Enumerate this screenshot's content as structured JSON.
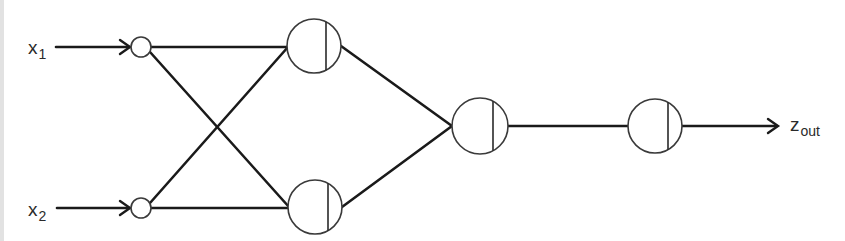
{
  "diagram": {
    "type": "feedforward-neural-network",
    "inputs": [
      {
        "id": "x1",
        "label": "x",
        "subscript": "1",
        "x": 28,
        "y": 54,
        "arrow_from": 56,
        "node": {
          "cx": 141,
          "cy": 47,
          "r": 10
        }
      },
      {
        "id": "x2",
        "label": "x",
        "subscript": "2",
        "x": 28,
        "y": 216,
        "arrow_from": 56,
        "node": {
          "cx": 141,
          "cy": 208,
          "r": 10
        }
      }
    ],
    "hidden_layer_1": [
      {
        "id": "h1",
        "cx": 314,
        "cy": 46,
        "r": 27,
        "divider_x": 326
      },
      {
        "id": "h2",
        "cx": 315,
        "cy": 207,
        "r": 27,
        "divider_x": 328
      }
    ],
    "hidden_layer_2": [
      {
        "id": "h3",
        "cx": 480,
        "cy": 126,
        "r": 28,
        "divider_x": 493
      }
    ],
    "output_layer": [
      {
        "id": "o1",
        "cx": 655,
        "cy": 126,
        "r": 27,
        "divider_x": 668
      }
    ],
    "output": {
      "label": "z",
      "subscript": "out",
      "arrow_to": 778,
      "x": 790,
      "y": 133
    },
    "connections": [
      {
        "from": "x1",
        "to": "h1"
      },
      {
        "from": "x1",
        "to": "h2"
      },
      {
        "from": "x2",
        "to": "h1"
      },
      {
        "from": "x2",
        "to": "h2"
      },
      {
        "from": "h1",
        "to": "h3"
      },
      {
        "from": "h2",
        "to": "h3"
      },
      {
        "from": "h3",
        "to": "o1"
      },
      {
        "from": "o1",
        "to": "z_out"
      }
    ],
    "colors": {
      "line": "#1a1a1a",
      "node_stroke": "#3a3a3a",
      "background": "#ffffff",
      "left_edge": "#e2e2e2"
    }
  }
}
